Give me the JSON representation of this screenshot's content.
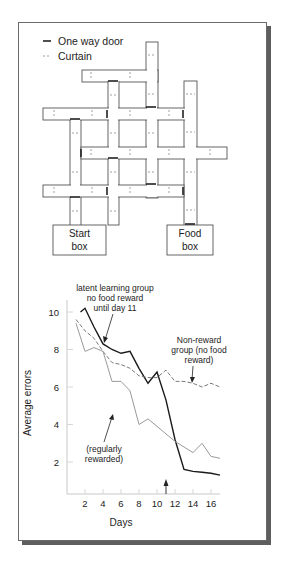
{
  "legend": {
    "one_way_door": "One way door",
    "curtain": "Curtain"
  },
  "maze": {
    "start_box": [
      "Start",
      "box"
    ],
    "food_box": [
      "Food",
      "box"
    ]
  },
  "annotations": {
    "latent": [
      "latent learning group",
      "no food reward",
      "until day 11"
    ],
    "nonreward": [
      "Non-reward",
      "group (no food",
      "reward)"
    ],
    "rewarded": [
      "(regularly",
      "rewarded)"
    ]
  },
  "colors": {
    "latent": "#1a1a1a",
    "nonreward": "#7a7a7a",
    "rewarded": "#9a9a9a",
    "frame_shadow": "#5e5e5e"
  },
  "chart_data": {
    "type": "line",
    "title": "",
    "xlabel": "Days",
    "ylabel": "Average errors",
    "xlim": [
      0,
      17
    ],
    "ylim": [
      0,
      10.5
    ],
    "xticks": [
      2,
      4,
      6,
      8,
      10,
      12,
      14,
      16
    ],
    "yticks": [
      2,
      4,
      6,
      8,
      10
    ],
    "grid": false,
    "marker_day": 11,
    "series": [
      {
        "name": "latent learning group no food reward until day 11",
        "style": "solid-dark",
        "x": [
          1.5,
          2,
          3,
          4,
          5,
          6,
          7,
          8,
          9,
          10,
          11,
          12,
          13,
          14,
          15,
          16,
          17
        ],
        "values": [
          10.0,
          10.2,
          9.2,
          8.3,
          8.0,
          7.8,
          7.9,
          7.0,
          6.2,
          6.8,
          5.3,
          3.2,
          1.6,
          1.5,
          1.45,
          1.4,
          1.3
        ]
      },
      {
        "name": "Non-reward group (no food reward)",
        "style": "dashed",
        "x": [
          1,
          2,
          3,
          4,
          5,
          6,
          7,
          8,
          9,
          10,
          11,
          12,
          13,
          14,
          15,
          16,
          17
        ],
        "values": [
          9.6,
          9.0,
          8.6,
          7.9,
          7.3,
          7.2,
          7.0,
          6.6,
          6.5,
          6.5,
          6.9,
          6.3,
          6.3,
          6.2,
          6.0,
          6.2,
          6.0
        ]
      },
      {
        "name": "(regularly rewarded)",
        "style": "solid-light",
        "x": [
          1,
          2,
          3,
          4,
          5,
          6,
          7,
          8,
          9,
          10,
          11,
          12,
          13,
          14,
          15,
          16,
          17
        ],
        "values": [
          9.4,
          7.9,
          8.1,
          7.9,
          6.3,
          6.3,
          5.8,
          4.0,
          4.3,
          3.9,
          3.5,
          3.1,
          2.8,
          2.5,
          3.0,
          2.3,
          2.2
        ]
      }
    ]
  }
}
